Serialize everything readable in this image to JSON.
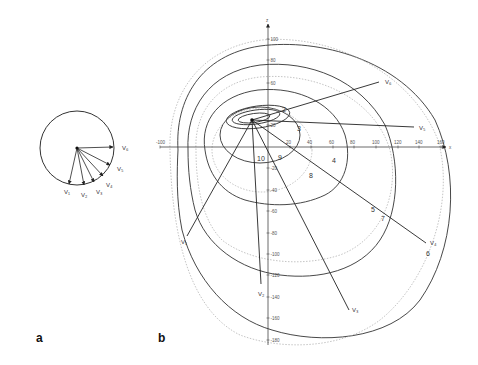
{
  "panels": {
    "a": {
      "label": "a"
    },
    "b": {
      "label": "b"
    }
  },
  "panel_a": {
    "circle": {
      "cx": 77,
      "cy": 148,
      "r": 37
    },
    "vectors": [
      {
        "name": "V1",
        "label": "V₁",
        "x2": 69,
        "y2": 184,
        "lx": 64,
        "ly": 194
      },
      {
        "name": "V2",
        "label": "V₂",
        "x2": 84,
        "y2": 185,
        "lx": 81,
        "ly": 197
      },
      {
        "name": "V3",
        "label": "V₃",
        "x2": 94,
        "y2": 182,
        "lx": 96,
        "ly": 194
      },
      {
        "name": "V4",
        "label": "V₄",
        "x2": 103,
        "y2": 176,
        "lx": 106,
        "ly": 187
      },
      {
        "name": "V5",
        "label": "V₅",
        "x2": 110,
        "y2": 165,
        "lx": 117,
        "ly": 171
      },
      {
        "name": "V6",
        "label": "V₆",
        "x2": 113,
        "y2": 147,
        "lx": 122,
        "ly": 150
      }
    ]
  },
  "panel_b": {
    "origin": {
      "x": 268,
      "y": 147
    },
    "hub": {
      "x": 252,
      "y": 120
    },
    "axes": {
      "x_label": "x",
      "z_label": "z",
      "x_ticks": [
        {
          "v": "-100",
          "x": 160
        },
        {
          "v": "20",
          "x": 290
        },
        {
          "v": "40",
          "x": 311
        },
        {
          "v": "60",
          "x": 333
        },
        {
          "v": "80",
          "x": 354
        },
        {
          "v": "100",
          "x": 376
        },
        {
          "v": "120",
          "x": 398
        },
        {
          "v": "140",
          "x": 419
        },
        {
          "v": "160",
          "x": 441
        }
      ],
      "z_ticks": [
        {
          "v": "100",
          "y": 39
        },
        {
          "v": "80",
          "y": 60
        },
        {
          "v": "60",
          "y": 83
        },
        {
          "v": "20",
          "y": 125
        },
        {
          "v": "-20",
          "y": 168
        },
        {
          "v": "-40",
          "y": 190
        },
        {
          "v": "-60",
          "y": 211
        },
        {
          "v": "-80",
          "y": 233
        },
        {
          "v": "-100",
          "y": 254
        },
        {
          "v": "-120",
          "y": 275
        },
        {
          "v": "-140",
          "y": 297
        },
        {
          "v": "-160",
          "y": 318
        },
        {
          "v": "-180",
          "y": 340
        }
      ]
    },
    "vectors": [
      {
        "name": "V1",
        "label": "V₁",
        "x2": 187,
        "y2": 236,
        "lx": 181,
        "ly": 244
      },
      {
        "name": "V2",
        "label": "V₂",
        "x2": 261,
        "y2": 284,
        "lx": 258,
        "ly": 296
      },
      {
        "name": "V3",
        "label": "V₃",
        "x2": 349,
        "y2": 310,
        "lx": 352,
        "ly": 312
      },
      {
        "name": "V4",
        "label": "V₄",
        "x2": 426,
        "y2": 243,
        "lx": 430,
        "ly": 245
      },
      {
        "name": "V5",
        "label": "V₅",
        "x2": 414,
        "y2": 127,
        "lx": 419,
        "ly": 130
      },
      {
        "name": "V6",
        "label": "V₆",
        "x2": 379,
        "y2": 82,
        "lx": 385,
        "ly": 84
      }
    ],
    "contour_numbers": [
      {
        "t": "2",
        "x": 282,
        "y": 112
      },
      {
        "t": "3",
        "x": 297,
        "y": 131
      },
      {
        "t": "4",
        "x": 332,
        "y": 163
      },
      {
        "t": "5",
        "x": 371,
        "y": 212
      },
      {
        "t": "6",
        "x": 426,
        "y": 256
      },
      {
        "t": "7",
        "x": 381,
        "y": 221
      },
      {
        "t": "8",
        "x": 309,
        "y": 178
      },
      {
        "t": "9",
        "x": 278,
        "y": 160
      },
      {
        "t": "10",
        "x": 257,
        "y": 161
      }
    ]
  }
}
